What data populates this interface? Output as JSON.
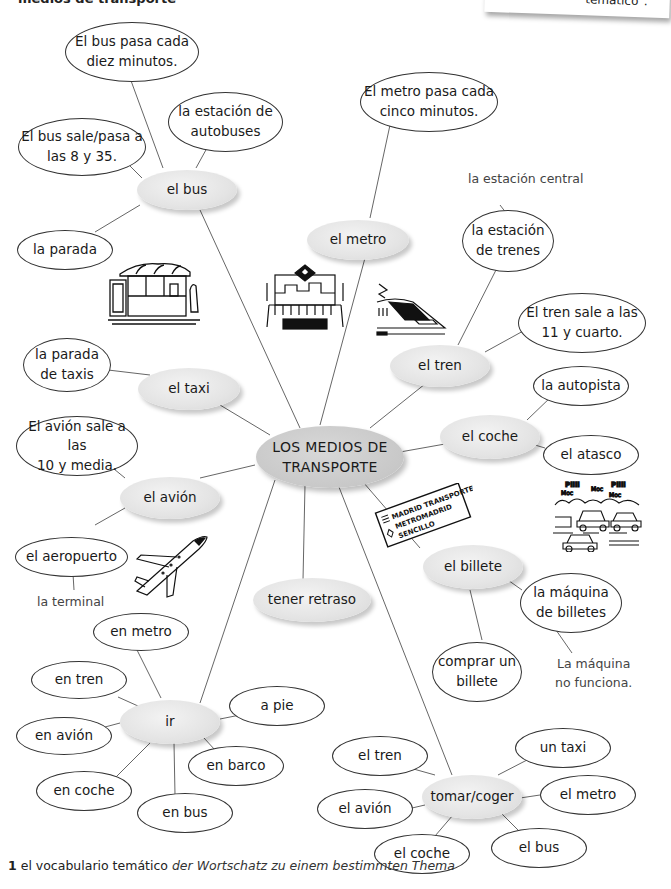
{
  "header": {
    "cut_title": "medios de transporte",
    "sticky_note_text": "temático\"."
  },
  "center": {
    "label": "LOS MEDIOS DE\nTRANSPORTE"
  },
  "hubs": {
    "bus": "el bus",
    "metro": "el metro",
    "tren": "el tren",
    "taxi": "el taxi",
    "coche": "el coche",
    "avion": "el avión",
    "billete": "el billete",
    "retraso": "tener retraso",
    "ir": "ir",
    "tomar": "tomar/coger"
  },
  "leaves": {
    "bus_cada": "El bus pasa cada\ndiez minutos.",
    "bus_estacion": "la estación de\nautobuses",
    "bus_sale": "El bus sale/pasa a\nlas 8 y 35.",
    "bus_parada": "la parada",
    "metro_cada": "El metro pasa cada\ncinco minutos.",
    "tren_estacion": "la estación\nde trenes",
    "tren_sale": "El tren sale a las\n11 y cuarto.",
    "taxi_parada": "la parada\nde taxis",
    "coche_autopista": "la autopista",
    "coche_atasco": "el atasco",
    "avion_sale": "El avión sale a las\n10 y media.",
    "avion_aeropuerto": "el aeropuerto",
    "billete_maquina": "la máquina\nde billetes",
    "billete_comprar": "comprar un\nbillete",
    "ir_metro": "en metro",
    "ir_tren": "en tren",
    "ir_avion": "en avión",
    "ir_coche": "en coche",
    "ir_bus": "en bus",
    "ir_barco": "en barco",
    "ir_pie": "a pie",
    "tomar_tren": "el tren",
    "tomar_avion": "el avión",
    "tomar_coche": "el coche",
    "tomar_bus": "el bus",
    "tomar_metro": "el metro",
    "tomar_taxi": "un taxi"
  },
  "notes": {
    "estacion_central": "la estación central",
    "terminal": "la terminal",
    "maquina_no": "La máquina\nno funciona."
  },
  "ticket": {
    "line1": "MADRID TRANSPORTES",
    "line2": "METROMADRID",
    "line3": "SENCILLO"
  },
  "traffic_sounds": [
    "Piiii",
    "Moc",
    "Piiii",
    "Moc",
    "Moc"
  ],
  "footnote": {
    "number": "1",
    "term": "el vocabulario temático",
    "translation": "der Wortschatz zu einem bestimmten Thema"
  }
}
